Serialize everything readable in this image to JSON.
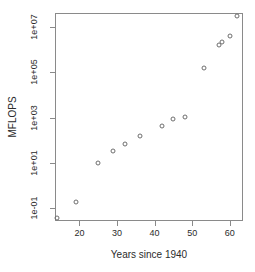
{
  "chart_data": {
    "type": "scatter",
    "title": "",
    "subtitle": "",
    "xlabel": "Years since 1940",
    "ylabel": "MFLOPS",
    "xlim": [
      13.5,
      63.5
    ],
    "ylim_log10": [
      -1.55,
      7.6
    ],
    "yscale": "log",
    "xscale": "linear",
    "grid": false,
    "legend": null,
    "xticks": [
      20,
      30,
      40,
      50,
      60
    ],
    "xtick_labels": [
      "20",
      "30",
      "40",
      "50",
      "60"
    ],
    "yticks": [
      0.1,
      10,
      1000,
      100000,
      10000000
    ],
    "ytick_labels": [
      "1e-01",
      "1e+01",
      "1e+03",
      "1e+05",
      "1e+07"
    ],
    "x": [
      14,
      19,
      25,
      29,
      32,
      36,
      42,
      45,
      48,
      53,
      57,
      58,
      60,
      62
    ],
    "y": [
      0.04,
      0.2,
      10,
      35,
      70,
      150,
      420,
      900,
      1100,
      150000,
      1500000,
      2200000,
      4000000,
      30000000
    ],
    "point_count": 14,
    "marker": "open-circle",
    "marker_color": "#6e6e6e"
  },
  "axes": {
    "frame_color": "#8a8a8a",
    "text_color": "#2b2b2b"
  }
}
